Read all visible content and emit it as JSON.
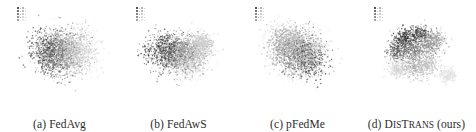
{
  "figure": {
    "kind": "tsne-embedding-comparison",
    "panel_count": 4,
    "background_color": "#ffffff",
    "caption_color": "#2b2b2b"
  },
  "legend": {
    "title": "",
    "columns": 2,
    "entries": [
      {
        "label": "0",
        "color": "#1a1a1a"
      },
      {
        "label": "1",
        "color": "#3d3d3d"
      },
      {
        "label": "2",
        "color": "#585858"
      },
      {
        "label": "3",
        "color": "#6f6f6f"
      },
      {
        "label": "4",
        "color": "#848484"
      },
      {
        "label": "5",
        "color": "#989898"
      },
      {
        "label": "6",
        "color": "#a9a9a9"
      },
      {
        "label": "7",
        "color": "#bcbcbc"
      },
      {
        "label": "8",
        "color": "#cfcfcf"
      },
      {
        "label": "9",
        "color": "#e0e0e0"
      }
    ]
  },
  "panels": [
    {
      "id": "a",
      "caption_prefix": "(a)",
      "caption_name": "FedAvg",
      "caption_suffix": "",
      "name_smallcaps": false
    },
    {
      "id": "b",
      "caption_prefix": "(b)",
      "caption_name": "FedAwS",
      "caption_suffix": "",
      "name_smallcaps": false
    },
    {
      "id": "c",
      "caption_prefix": "(c)",
      "caption_name": "pFedMe",
      "caption_suffix": "",
      "name_smallcaps": false
    },
    {
      "id": "d",
      "caption_prefix": "(d)",
      "caption_name": "DisTrans",
      "caption_suffix": "(ours)",
      "name_smallcaps": true
    }
  ],
  "chart_data": {
    "type": "scatter",
    "title": "",
    "xlabel": "",
    "ylabel": "",
    "grid": false,
    "axes_visible": false,
    "legend_position": "upper-left",
    "xlim": [
      -1,
      1
    ],
    "ylim": [
      -1,
      1
    ],
    "class_labels": [
      "0",
      "1",
      "2",
      "3",
      "4",
      "5",
      "6",
      "7",
      "8",
      "9"
    ],
    "class_colors": [
      "#1a1a1a",
      "#3d3d3d",
      "#585858",
      "#6f6f6f",
      "#848484",
      "#989898",
      "#a9a9a9",
      "#bcbcbc",
      "#cfcfcf",
      "#e0e0e0"
    ],
    "points_per_class": 260,
    "panels": [
      {
        "id": "a",
        "label": "FedAvg",
        "separation": "none",
        "description": "single merged blob, classes heavily overlapping",
        "clusters": [
          {
            "class": "0",
            "cx": -0.3,
            "cy": 0.1,
            "sx": 0.4,
            "sy": 0.42
          },
          {
            "class": "1",
            "cx": -0.22,
            "cy": -0.05,
            "sx": 0.42,
            "sy": 0.44
          },
          {
            "class": "2",
            "cx": -0.12,
            "cy": 0.18,
            "sx": 0.44,
            "sy": 0.4
          },
          {
            "class": "3",
            "cx": -0.05,
            "cy": -0.18,
            "sx": 0.42,
            "sy": 0.42
          },
          {
            "class": "4",
            "cx": 0.02,
            "cy": 0.05,
            "sx": 0.44,
            "sy": 0.44
          },
          {
            "class": "5",
            "cx": 0.1,
            "cy": 0.2,
            "sx": 0.42,
            "sy": 0.4
          },
          {
            "class": "6",
            "cx": 0.18,
            "cy": -0.1,
            "sx": 0.44,
            "sy": 0.42
          },
          {
            "class": "7",
            "cx": 0.28,
            "cy": 0.08,
            "sx": 0.42,
            "sy": 0.42
          },
          {
            "class": "8",
            "cx": 0.34,
            "cy": -0.02,
            "sx": 0.4,
            "sy": 0.4
          },
          {
            "class": "9",
            "cx": 0.4,
            "cy": 0.12,
            "sx": 0.4,
            "sy": 0.38
          }
        ]
      },
      {
        "id": "b",
        "label": "FedAwS",
        "separation": "weak",
        "description": "diffuse cloud with a darker lobe right of center",
        "clusters": [
          {
            "class": "0",
            "cx": -0.42,
            "cy": 0.02,
            "sx": 0.4,
            "sy": 0.34
          },
          {
            "class": "1",
            "cx": -0.3,
            "cy": 0.2,
            "sx": 0.42,
            "sy": 0.34
          },
          {
            "class": "2",
            "cx": -0.18,
            "cy": -0.14,
            "sx": 0.42,
            "sy": 0.34
          },
          {
            "class": "3",
            "cx": -0.04,
            "cy": 0.06,
            "sx": 0.42,
            "sy": 0.34
          },
          {
            "class": "4",
            "cx": 0.06,
            "cy": -0.16,
            "sx": 0.4,
            "sy": 0.34
          },
          {
            "class": "5",
            "cx": 0.14,
            "cy": 0.14,
            "sx": 0.4,
            "sy": 0.32
          },
          {
            "class": "6",
            "cx": 0.26,
            "cy": -0.06,
            "sx": 0.38,
            "sy": 0.32
          },
          {
            "class": "7",
            "cx": 0.4,
            "cy": 0.18,
            "sx": 0.3,
            "sy": 0.26
          },
          {
            "class": "8",
            "cx": 0.46,
            "cy": 0.26,
            "sx": 0.24,
            "sy": 0.22
          },
          {
            "class": "9",
            "cx": 0.16,
            "cy": -0.28,
            "sx": 0.4,
            "sy": 0.28
          }
        ]
      },
      {
        "id": "c",
        "label": "pFedMe",
        "separation": "weak",
        "description": "light diffuse cloud, darker mass toward lower right",
        "clusters": [
          {
            "class": "0",
            "cx": 0.22,
            "cy": -0.18,
            "sx": 0.38,
            "sy": 0.4
          },
          {
            "class": "1",
            "cx": 0.12,
            "cy": -0.04,
            "sx": 0.4,
            "sy": 0.42
          },
          {
            "class": "2",
            "cx": 0.02,
            "cy": 0.12,
            "sx": 0.42,
            "sy": 0.42
          },
          {
            "class": "3",
            "cx": -0.1,
            "cy": -0.1,
            "sx": 0.42,
            "sy": 0.42
          },
          {
            "class": "4",
            "cx": -0.2,
            "cy": 0.18,
            "sx": 0.42,
            "sy": 0.4
          },
          {
            "class": "5",
            "cx": -0.3,
            "cy": 0.04,
            "sx": 0.42,
            "sy": 0.42
          },
          {
            "class": "6",
            "cx": -0.36,
            "cy": 0.24,
            "sx": 0.4,
            "sy": 0.38
          },
          {
            "class": "7",
            "cx": -0.14,
            "cy": 0.3,
            "sx": 0.42,
            "sy": 0.36
          },
          {
            "class": "8",
            "cx": 0.3,
            "cy": 0.1,
            "sx": 0.36,
            "sy": 0.4
          },
          {
            "class": "9",
            "cx": 0.06,
            "cy": -0.3,
            "sx": 0.4,
            "sy": 0.34
          }
        ]
      },
      {
        "id": "d",
        "label": "DisTrans",
        "separation": "strong",
        "description": "several visually distinct lobes; isolated light cluster at lower right",
        "clusters": [
          {
            "class": "0",
            "cx": -0.3,
            "cy": 0.34,
            "sx": 0.22,
            "sy": 0.22
          },
          {
            "class": "1",
            "cx": 0.02,
            "cy": 0.44,
            "sx": 0.24,
            "sy": 0.2
          },
          {
            "class": "2",
            "cx": -0.46,
            "cy": 0.06,
            "sx": 0.2,
            "sy": 0.22
          },
          {
            "class": "3",
            "cx": -0.16,
            "cy": 0.06,
            "sx": 0.24,
            "sy": 0.24
          },
          {
            "class": "4",
            "cx": 0.16,
            "cy": 0.16,
            "sx": 0.26,
            "sy": 0.26
          },
          {
            "class": "5",
            "cx": 0.34,
            "cy": 0.3,
            "sx": 0.22,
            "sy": 0.22
          },
          {
            "class": "6",
            "cx": -0.1,
            "cy": -0.3,
            "sx": 0.26,
            "sy": 0.24
          },
          {
            "class": "7",
            "cx": 0.2,
            "cy": -0.24,
            "sx": 0.24,
            "sy": 0.24
          },
          {
            "class": "8",
            "cx": -0.44,
            "cy": -0.34,
            "sx": 0.2,
            "sy": 0.18
          },
          {
            "class": "9",
            "cx": 0.62,
            "cy": -0.46,
            "sx": 0.18,
            "sy": 0.16
          }
        ]
      }
    ]
  }
}
